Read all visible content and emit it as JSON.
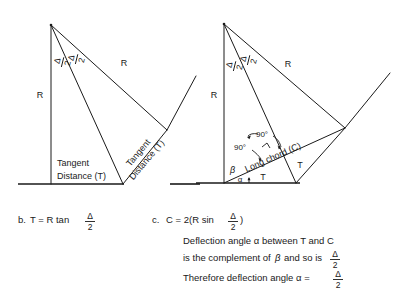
{
  "figure": {
    "title_hidden": "Tangent distance and long chord geometry of a circular curve",
    "delta_symbol": "Δ",
    "two": "2",
    "degree_90": "90°",
    "alpha": "α",
    "beta": "β"
  },
  "left_diagram": {
    "label_radius_vertical": "R",
    "label_radius_slant": "R",
    "label_tangent_line1": "Tangent",
    "label_tangent_line2": "Distance (T)",
    "label_tangent_rotated_line1": "Tangent",
    "label_tangent_rotated_line2": "Distance (T)",
    "half_delta_left_num": "Δ",
    "half_delta_left_den": "2",
    "half_delta_right_num": "Δ",
    "half_delta_right_den": "2"
  },
  "right_diagram": {
    "label_radius_vertical": "R",
    "label_radius_slant": "R",
    "label_long_chord": "Long chord (C)",
    "label_tangent_left": "T",
    "label_tangent_right": "T",
    "label_angle_beta": "β",
    "label_angle_alpha": "α",
    "label_right_angle_1": "90°",
    "label_right_angle_2": "90°",
    "half_delta_left_num": "Δ",
    "half_delta_left_den": "2",
    "half_delta_right_num": "Δ",
    "half_delta_right_den": "2"
  },
  "caption_b": {
    "marker": "b.",
    "formula_prefix": "T = R tan",
    "frac_num": "Δ",
    "frac_den": "2"
  },
  "caption_c": {
    "marker": "c.",
    "formula_prefix": "C = 2(R sin",
    "formula_frac_num": "Δ",
    "formula_frac_den": "2",
    "formula_suffix": ")",
    "line2": "Deflection angle α between T and C",
    "line3_a": "is the complement of",
    "line3_beta": "β",
    "line3_b": "and so is",
    "line3_frac_num": "Δ",
    "line3_frac_den": "2",
    "line4": "Therefore deflection angle α =",
    "line4_frac_num": "Δ",
    "line4_frac_den": "2"
  }
}
